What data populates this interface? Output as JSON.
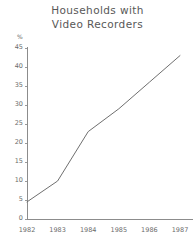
{
  "chart_data": {
    "type": "line",
    "title": "Households with\nVideo Recorders",
    "title_line1": "Households with",
    "title_line2": "Video Recorders",
    "xlabel": "",
    "ylabel": "%",
    "y_unit": "%",
    "categories": [
      "1982",
      "1983",
      "1984",
      "1985",
      "1986",
      "1987"
    ],
    "x": [
      1982,
      1983,
      1984,
      1985,
      1986,
      1987
    ],
    "values": [
      4.5,
      10,
      23,
      29,
      36,
      43
    ],
    "series": [
      {
        "name": "Households with video recorders",
        "values": [
          4.5,
          10,
          23,
          29,
          36,
          43
        ]
      }
    ],
    "ylim": [
      0,
      45
    ],
    "yticks": [
      0,
      5,
      10,
      15,
      20,
      25,
      30,
      35,
      40,
      45
    ],
    "ytick_labels": [
      "0",
      "5",
      "10",
      "15",
      "20",
      "25",
      "30",
      "35",
      "40",
      "45"
    ],
    "xtick_labels": [
      "1982",
      "1983",
      "1984",
      "1985",
      "1986",
      "1987"
    ],
    "grid": false,
    "legend": false,
    "legend_position": "none",
    "line_color": "#6f6f6f",
    "axis_color": "#8c8c8c",
    "text_color": "#6b6b6b",
    "background_color": "#ffffff"
  }
}
